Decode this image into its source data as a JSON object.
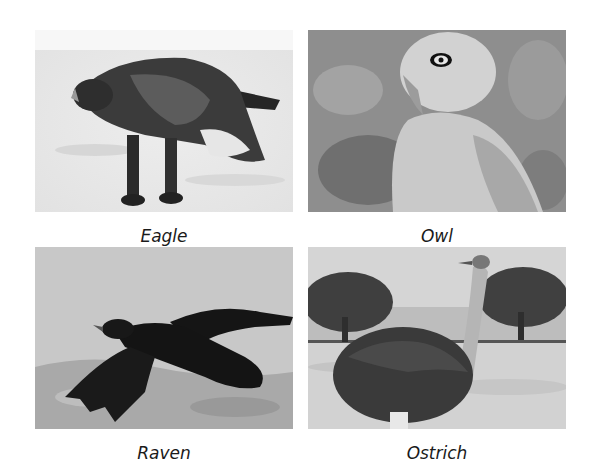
{
  "grid": {
    "items": [
      {
        "label": "Eagle",
        "subject": "eagle-photo",
        "palette": {
          "bg": "#ececec",
          "subject": "#2e2e2e"
        }
      },
      {
        "label": "Owl",
        "subject": "owl-photo",
        "palette": {
          "bg": "#8f8f8f",
          "subject": "#d8d8d8"
        }
      },
      {
        "label": "Raven",
        "subject": "raven-photo",
        "palette": {
          "bg": "#c9c9c9",
          "subject": "#151515"
        }
      },
      {
        "label": "Ostrich",
        "subject": "ostrich-photo",
        "palette": {
          "bg": "#d0d0d0",
          "subject": "#3a3a3a"
        }
      }
    ]
  }
}
